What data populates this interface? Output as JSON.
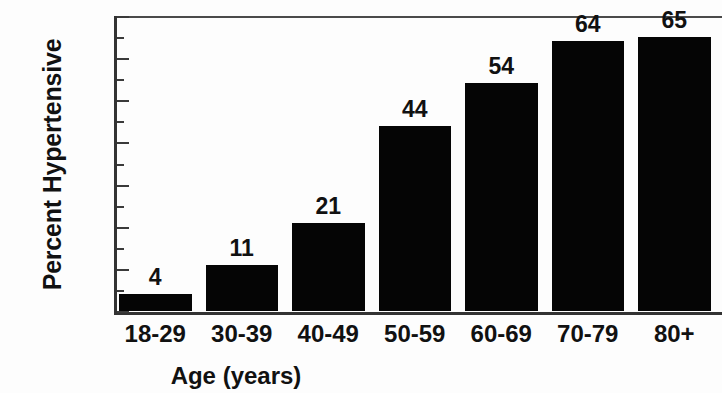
{
  "chart_data": {
    "type": "bar",
    "title": "",
    "xlabel": "Age (years)",
    "ylabel": "Percent Hypertensive",
    "categories": [
      "18-29",
      "30-39",
      "40-49",
      "50-59",
      "60-69",
      "70-79",
      "80+"
    ],
    "values": [
      4,
      11,
      21,
      44,
      54,
      64,
      65
    ],
    "value_labels": [
      "4",
      "11",
      "21",
      "44",
      "54",
      "64",
      "65"
    ],
    "ylim": [
      0,
      70
    ],
    "ytick_labels": [
      "0",
      "10",
      "20",
      "30",
      "40",
      "50",
      "60",
      "70"
    ],
    "ytick_values": [
      0,
      10,
      20,
      30,
      40,
      50,
      60,
      70
    ],
    "yminor_tick_values": [
      5,
      15,
      25,
      35,
      45,
      55,
      65
    ],
    "grid": false,
    "legend": null,
    "bar_color": "#050505",
    "axis_color": "#333333",
    "text_color": "#111111",
    "background": "#fdfdfd"
  }
}
